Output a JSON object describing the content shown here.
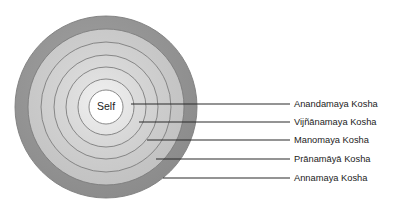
{
  "diagram": {
    "center_label": "Self",
    "center": {
      "cx": 106,
      "cy": 107
    },
    "rings": [
      {
        "name": "annamaya-ring",
        "radius": 91,
        "fill": "#909090",
        "label": "Annamaya Kosha"
      },
      {
        "name": "pranamaya-ring",
        "radius": 78,
        "fill": "#c9c9c9",
        "label": "Prānamāyā Kosha"
      },
      {
        "name": "manomaya-ring",
        "radius": 65,
        "fill": "#cfcfcf",
        "label": "Manomaya Kosha"
      },
      {
        "name": "vijnanamaya-ring",
        "radius": 52,
        "fill": "#d6d6d6",
        "label": "Vijñānamaya Kosha"
      },
      {
        "name": "anandamaya-ring",
        "radius": 40,
        "fill": "#dddddd",
        "label": "Anandamaya Kosha"
      },
      {
        "name": "inner-ring",
        "radius": 28,
        "fill": "#e8e8e8",
        "label": ""
      },
      {
        "name": "self-core",
        "radius": 17,
        "fill": "#ffffff",
        "label": ""
      }
    ],
    "callouts": [
      {
        "name": "callout-anandamaya",
        "label": "Anandamaya Kosha",
        "line_y": 104,
        "line_x_start": 131,
        "line_x_end": 290,
        "text_x": 294,
        "text_y": 104
      },
      {
        "name": "callout-vijnanamaya",
        "label": "Vijñānamaya Kosha",
        "line_y": 122,
        "line_x_start": 139,
        "line_x_end": 290,
        "text_x": 294,
        "text_y": 122
      },
      {
        "name": "callout-manomaya",
        "label": "Manomaya Kosha",
        "line_y": 140,
        "line_x_start": 147,
        "line_x_end": 290,
        "text_x": 294,
        "text_y": 140
      },
      {
        "name": "callout-pranamaya",
        "label": "Prānamāyā Kosha",
        "line_y": 159,
        "line_x_start": 156,
        "line_x_end": 290,
        "text_x": 294,
        "text_y": 159
      },
      {
        "name": "callout-annamaya",
        "label": "Annamaya Kosha",
        "line_y": 178,
        "line_x_start": 163,
        "line_x_end": 290,
        "text_x": 294,
        "text_y": 178
      }
    ],
    "colors": {
      "outer_ring": "#909090",
      "ring_stroke": "#7d7d7d",
      "leader_line": "#2b2b2b",
      "text": "#1b1b1b",
      "background": "#ffffff",
      "core": "#ffffff"
    }
  }
}
